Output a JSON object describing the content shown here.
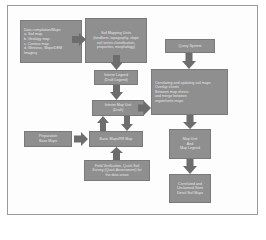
{
  "colors": {
    "box_fill": "#8f8f8f",
    "box_border": "#7a7a7a",
    "arrow": "#6d6d6d",
    "text": "#e6e6e6",
    "frame": "#9a9a9a"
  },
  "nodes": {
    "data_compilation": {
      "lines": [
        "Data compilation/Maps",
        "a. Soil map,",
        "b. Geology map,",
        "c. Contour map,",
        "d. Wetness, Slope/DEM",
        "Imagery"
      ]
    },
    "soil_mapping": {
      "lines": [
        "Soil Mapping Units",
        "(landform, topography, slope",
        "soil series classification,",
        "properties, morphology)"
      ]
    },
    "query_system": {
      "lines": [
        "Query System"
      ]
    },
    "correlating": {
      "lines": [
        "Correlating and updating soil maps",
        "Overlap sheets",
        "Between map sheets",
        "and merge between",
        "region/units maps"
      ]
    },
    "interim_legend": {
      "lines": [
        "Interim Legend",
        "(Draft Legend)"
      ]
    },
    "interim_map_unit": {
      "lines": [
        "Interim Map Unit",
        "(Draft)"
      ]
    },
    "preparation_base_maps": {
      "lines": [
        "Preparation",
        "Base Maps"
      ]
    },
    "base_maps": {
      "lines": [
        "Basic Maps/RR Map"
      ]
    },
    "field_verification": {
      "lines": [
        "Field Verification, Quick Soil",
        "Survey (Quick Assessment) for",
        "the data areas"
      ]
    },
    "map_unit_legend": {
      "lines": [
        "Map Unit",
        "And",
        "Map Legend"
      ]
    },
    "correlated_maps": {
      "lines": [
        "Correlated and",
        "Unclaimed Semi",
        "Detail Soil Maps"
      ]
    }
  },
  "edges": [
    {
      "from": "data_compilation",
      "to": "soil_mapping",
      "direction": "right"
    },
    {
      "from": "soil_mapping",
      "to": "interim_legend",
      "direction": "down"
    },
    {
      "from": "interim_legend",
      "to": "interim_map_unit",
      "direction": "down"
    },
    {
      "from": "interim_map_unit",
      "to": "correlating",
      "direction": "right"
    },
    {
      "from": "interim_map_unit",
      "to": "base_maps",
      "direction": "down"
    },
    {
      "from": "base_maps",
      "to": "interim_map_unit",
      "direction": "up"
    },
    {
      "from": "preparation_base_maps",
      "to": "base_maps",
      "direction": "right"
    },
    {
      "from": "field_verification",
      "to": "base_maps",
      "direction": "up"
    },
    {
      "from": "query_system",
      "to": "correlating",
      "direction": "down"
    },
    {
      "from": "correlating",
      "to": "map_unit_legend",
      "direction": "down"
    },
    {
      "from": "map_unit_legend",
      "to": "correlated_maps",
      "direction": "down"
    }
  ]
}
